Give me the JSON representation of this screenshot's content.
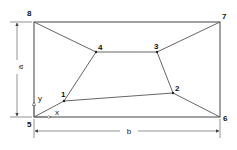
{
  "diagram": {
    "type": "quadrilateral-mesh-in-rectangle",
    "nodes": [
      {
        "id": "1",
        "label": "1",
        "x": 64,
        "y": 101
      },
      {
        "id": "2",
        "label": "2",
        "x": 173,
        "y": 93
      },
      {
        "id": "3",
        "label": "3",
        "x": 157,
        "y": 52
      },
      {
        "id": "4",
        "label": "4",
        "x": 96,
        "y": 52
      },
      {
        "id": "5",
        "label": "5",
        "x": 34,
        "y": 117
      },
      {
        "id": "6",
        "label": "6",
        "x": 220,
        "y": 117
      },
      {
        "id": "7",
        "label": "7",
        "x": 220,
        "y": 22
      },
      {
        "id": "8",
        "label": "8",
        "x": 34,
        "y": 22
      }
    ],
    "edges": [
      [
        "5",
        "6"
      ],
      [
        "6",
        "7"
      ],
      [
        "7",
        "8"
      ],
      [
        "8",
        "5"
      ],
      [
        "1",
        "2"
      ],
      [
        "2",
        "3"
      ],
      [
        "3",
        "4"
      ],
      [
        "4",
        "1"
      ],
      [
        "5",
        "1"
      ],
      [
        "6",
        "2"
      ],
      [
        "7",
        "3"
      ],
      [
        "8",
        "4"
      ]
    ],
    "dimensions": {
      "height_label": "a",
      "width_label": "b"
    },
    "axes": {
      "x_label": "x",
      "y_label": "y"
    }
  }
}
